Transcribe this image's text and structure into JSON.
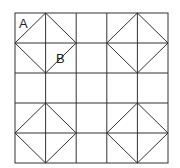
{
  "diagram": {
    "type": "quilt-block-grid",
    "grid": {
      "rows": 5,
      "cols": 5,
      "left": 15,
      "top": 13,
      "cell": 30.6
    },
    "labels": [
      {
        "text": "A",
        "x": 19,
        "y": 28
      },
      {
        "text": "B",
        "x": 56,
        "y": 63
      }
    ],
    "line_color": "#333333"
  }
}
